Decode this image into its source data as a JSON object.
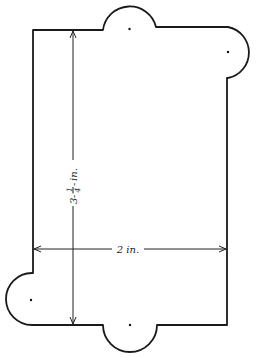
{
  "diagram": {
    "type": "technical drawing",
    "shape": "rectangular tab template with semicircular lobes",
    "dimensions": {
      "height": {
        "label_whole": "3",
        "label_num": "1",
        "label_den": "4",
        "label_unit": "in.",
        "full_text": "3-1/4 in."
      },
      "width": {
        "label": "2 in."
      }
    },
    "lobes": [
      {
        "position": "top-center",
        "shape": "semicircle"
      },
      {
        "position": "top-right",
        "shape": "semicircle"
      },
      {
        "position": "bottom-left",
        "shape": "semicircle"
      },
      {
        "position": "bottom-center",
        "shape": "semicircle"
      }
    ],
    "center_marks": 4,
    "colors": {
      "line": "#1a1a1a",
      "background": "#ffffff"
    }
  }
}
